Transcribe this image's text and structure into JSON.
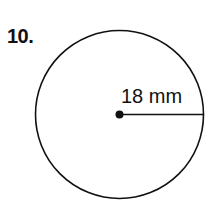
{
  "problem": {
    "number": "10.",
    "figure": "circle",
    "radius_label": "18 mm",
    "radius_value": 18,
    "unit": "mm"
  }
}
